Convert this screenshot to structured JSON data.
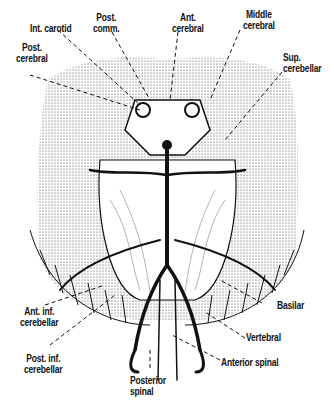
{
  "figure": {
    "labels": {
      "int_carotid": "Int. carotid",
      "post_comm_1": "Post.",
      "post_comm_2": "comm.",
      "ant_cerebral_1": "Ant.",
      "ant_cerebral_2": "cerebral",
      "middle_cerebral_1": "Middle",
      "middle_cerebral_2": "cerebral",
      "post_cerebral_1": "Post.",
      "post_cerebral_2": "cerebral",
      "sup_cerebellar_1": "Sup.",
      "sup_cerebellar_2": "cerebellar",
      "ant_inf_cerebellar_1": "Ant. inf.",
      "ant_inf_cerebellar_2": "cerebellar",
      "post_inf_cerebellar_1": "Post. inf.",
      "post_inf_cerebellar_2": "cerebellar",
      "basilar": "Basilar",
      "vertebral": "Vertebral",
      "anterior_spinal": "Anterior spinal",
      "posterior_spinal_1": "Posterior",
      "posterior_spinal_2": "spinal"
    }
  },
  "colors": {
    "ink": "#111111",
    "background": "#ffffff"
  }
}
